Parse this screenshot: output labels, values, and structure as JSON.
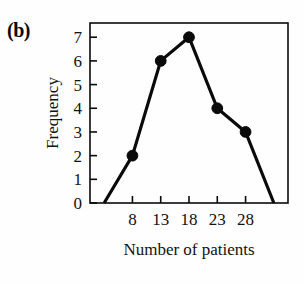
{
  "figure": {
    "panel_label": "(b)",
    "background_color": "#fefefe",
    "ink_color": "#0a0a0a"
  },
  "chart_data": {
    "type": "line",
    "title": "",
    "subtitle": "",
    "xlabel": "Number of patients",
    "ylabel": "Frequency",
    "x": [
      3,
      8,
      13,
      18,
      23,
      28,
      33
    ],
    "values": [
      0,
      2,
      6,
      7,
      4,
      3,
      0
    ],
    "series": [
      {
        "name": "Frequency",
        "x": [
          3,
          8,
          13,
          18,
          23,
          28,
          33
        ],
        "values": [
          0,
          2,
          6,
          7,
          4,
          3,
          0
        ],
        "marker": "filled-circle",
        "marker_color": "#0a0a0a",
        "line_color": "#0a0a0a",
        "markers_at_x": [
          8,
          13,
          18,
          23,
          28
        ]
      }
    ],
    "xlim": [
      0.5,
      35.5
    ],
    "ylim": [
      0,
      7.6
    ],
    "xticks": [
      8,
      13,
      18,
      23,
      28
    ],
    "xtick_labels": [
      "8",
      "13",
      "18",
      "23",
      "28"
    ],
    "yticks": [
      0,
      1,
      2,
      3,
      4,
      5,
      6,
      7
    ],
    "ytick_labels": [
      "0",
      "1",
      "2",
      "3",
      "4",
      "5",
      "6",
      "7"
    ],
    "grid": false,
    "legend": false,
    "legend_position": "none",
    "tick_direction": "in",
    "frame": "box",
    "annotations": []
  }
}
